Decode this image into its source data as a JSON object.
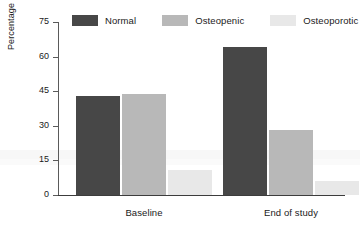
{
  "chart_data": {
    "type": "bar",
    "title": "",
    "xlabel": "",
    "ylabel": "Percentage of subjects",
    "ylim": [
      0,
      75
    ],
    "yticks": [
      0,
      15,
      30,
      45,
      60,
      75
    ],
    "grid": false,
    "legend_position": "top",
    "categories": [
      "Baseline",
      "End of study"
    ],
    "series": [
      {
        "name": "Normal",
        "color": "#474747",
        "values": [
          43,
          64
        ]
      },
      {
        "name": "Osteopenic",
        "color": "#b8b8b8",
        "values": [
          44,
          28
        ]
      },
      {
        "name": "Osteoporotic",
        "color": "#e8e8e8",
        "values": [
          11,
          6
        ]
      }
    ]
  },
  "legend": {
    "items": [
      {
        "label": "Normal"
      },
      {
        "label": "Osteopenic"
      },
      {
        "label": "Osteoporotic"
      }
    ]
  },
  "axes": {
    "y_title": "Percentage of subjects",
    "y_tick_labels": [
      "75",
      "60",
      "45",
      "30",
      "15",
      "0"
    ],
    "x_tick_labels": [
      "Baseline",
      "End of study"
    ]
  }
}
